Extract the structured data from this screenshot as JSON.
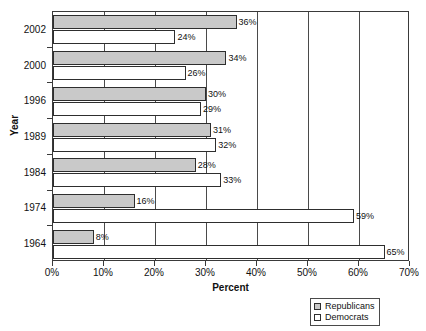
{
  "chart_data": {
    "type": "bar",
    "orientation": "horizontal",
    "title": "",
    "xlabel": "Percent",
    "ylabel": "Year",
    "xlim": [
      0,
      70
    ],
    "xticks": [
      "0%",
      "10%",
      "20%",
      "30%",
      "40%",
      "50%",
      "60%",
      "70%"
    ],
    "xtick_values": [
      0,
      10,
      20,
      30,
      40,
      50,
      60,
      70
    ],
    "grid": true,
    "categories": [
      "2002",
      "2000",
      "1996",
      "1989",
      "1984",
      "1974",
      "1964"
    ],
    "series": [
      {
        "name": "Republicans",
        "color": "#c9c9c9",
        "values": [
          36,
          34,
          30,
          31,
          28,
          16,
          8
        ],
        "labels": [
          "36%",
          "34%",
          "30%",
          "31%",
          "28%",
          "16%",
          "8%"
        ]
      },
      {
        "name": "Democrats",
        "color": "#ffffff",
        "values": [
          24,
          26,
          29,
          32,
          33,
          59,
          65
        ],
        "labels": [
          "24%",
          "26%",
          "29%",
          "32%",
          "33%",
          "59%",
          "65%"
        ]
      }
    ],
    "legend": {
      "position": "bottom-right",
      "entries": [
        "Republicans",
        "Democrats"
      ]
    }
  }
}
